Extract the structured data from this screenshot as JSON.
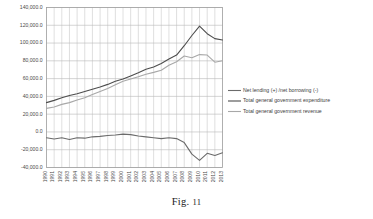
{
  "caption": {
    "prefix": "Fig.",
    "number": "11"
  },
  "chart_data": {
    "type": "line",
    "title": "",
    "xlabel": "",
    "ylabel": "",
    "grid": true,
    "legend_position": "right",
    "ylim": [
      -40000,
      140000
    ],
    "ytick_values": [
      140000,
      120000,
      100000,
      80000,
      60000,
      40000,
      20000,
      0,
      -20000,
      -40000
    ],
    "ytick_labels": [
      "140,000.0",
      "120,000.0",
      "100,000.0",
      "80,000.0",
      "60,000.0",
      "40,000.0",
      "20,000.0",
      "0.0",
      "-20,000.0",
      "-40,000.0"
    ],
    "categories": [
      "1990",
      "1991",
      "1992",
      "1993",
      "1994",
      "1995",
      "1996",
      "1997",
      "1998",
      "1999",
      "2000",
      "2001",
      "2002",
      "2003",
      "2004",
      "2005",
      "2006",
      "2007",
      "2008",
      "2009",
      "2010",
      "2011",
      "2012",
      "2013"
    ],
    "series": [
      {
        "name": "Net lending (+) /net borrowing (-)",
        "color": "#6b6b6b",
        "values": [
          -6500,
          -8000,
          -6500,
          -8500,
          -6500,
          -7000,
          -5500,
          -5000,
          -4000,
          -3500,
          -2500,
          -3000,
          -4500,
          -5500,
          -6500,
          -7500,
          -6500,
          -7500,
          -12000,
          -25000,
          -32000,
          -24000,
          -26500,
          -23500
        ]
      },
      {
        "name": "Total general government expenditure",
        "color": "#4d4d4d",
        "values": [
          33000,
          35500,
          38500,
          41000,
          43000,
          45500,
          48000,
          50500,
          53500,
          57000,
          59500,
          63000,
          66500,
          70500,
          73000,
          77000,
          82000,
          86500,
          97000,
          108500,
          119000,
          110500,
          105000,
          103500
        ]
      },
      {
        "name": "Total general government revenue",
        "color": "#a8a8a8",
        "values": [
          26500,
          28000,
          31000,
          33000,
          36000,
          38500,
          42000,
          45500,
          49000,
          53000,
          57000,
          59500,
          62000,
          65000,
          67000,
          69500,
          75000,
          79000,
          85500,
          83500,
          87000,
          86500,
          78500,
          80000
        ]
      }
    ]
  }
}
